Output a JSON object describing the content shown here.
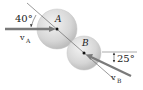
{
  "diagram": {
    "type": "oblique central impact",
    "balls": [
      {
        "id": "A",
        "label": "A",
        "cx": 57,
        "cy": 29,
        "r": 20
      },
      {
        "id": "B",
        "label": "B",
        "cx": 84,
        "cy": 53,
        "r": 17
      }
    ],
    "velocities": [
      {
        "id": "vA",
        "label": "v",
        "subscript": "A",
        "angle_label": "40°"
      },
      {
        "id": "vB",
        "label": "v",
        "subscript": "B",
        "angle_label": "25°"
      }
    ],
    "colors": {
      "ball_fill": "#d9d9d9",
      "ball_edge": "#b5b5b5",
      "arrow": "#7a7a7a",
      "line": "#555555",
      "text": "#222222"
    }
  }
}
